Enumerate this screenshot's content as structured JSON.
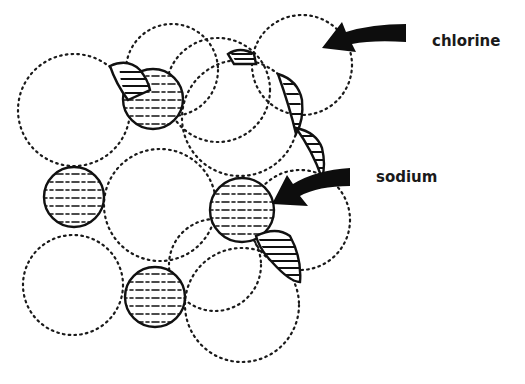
{
  "diagram": {
    "labels": {
      "chlorine": "chlorine",
      "sodium": "sodium"
    },
    "atoms": {
      "chlorine": {
        "style": "large dotted circle",
        "color": "#1a1a1a"
      },
      "sodium": {
        "style": "small hatched circle",
        "color": "#111111"
      }
    },
    "arrows": [
      {
        "name": "chlorine-arrow",
        "points_to": "chlorine",
        "color": "#0d0d0d"
      },
      {
        "name": "sodium-arrow",
        "points_to": "sodium",
        "color": "#0d0d0d"
      }
    ]
  }
}
